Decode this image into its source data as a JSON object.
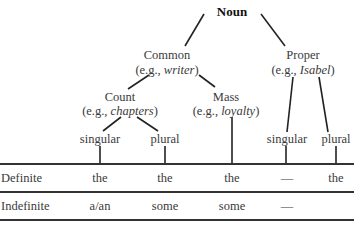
{
  "tree": {
    "root": "Noun",
    "common": {
      "label": "Common",
      "eg_prefix": "(e.g., ",
      "eg_word": "writer",
      "eg_suffix": ")"
    },
    "proper": {
      "label": "Proper",
      "eg_prefix": "(e.g., ",
      "eg_word": "Isabel",
      "eg_suffix": ")"
    },
    "count": {
      "label": "Count",
      "eg_prefix": "(e.g., ",
      "eg_word": "chapters",
      "eg_suffix": ")"
    },
    "mass": {
      "label": "Mass",
      "eg_prefix": "(e.g., ",
      "eg_word": "loyalty",
      "eg_suffix": ")"
    },
    "leaves": [
      "singular",
      "plural",
      "singular",
      "plural"
    ]
  },
  "table": {
    "rows": [
      {
        "header": "Definite",
        "cells": [
          "the",
          "the",
          "the",
          "—",
          "the"
        ]
      },
      {
        "header": "Indefinite",
        "cells": [
          "a/an",
          "some",
          "some",
          "—",
          ""
        ]
      }
    ]
  }
}
